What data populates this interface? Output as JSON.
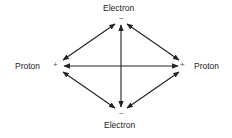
{
  "diagram": {
    "nodes": {
      "top": {
        "label": "Electron",
        "sign": "−"
      },
      "bottom": {
        "label": "Electron",
        "sign": "−"
      },
      "left": {
        "label": "Proton",
        "sign": "+"
      },
      "right": {
        "label": "Proton",
        "sign": "+"
      }
    },
    "arrows": [
      "top-left",
      "top-right",
      "top-bottom",
      "left-right",
      "left-bottom",
      "right-bottom"
    ],
    "line_color": "#222222"
  }
}
